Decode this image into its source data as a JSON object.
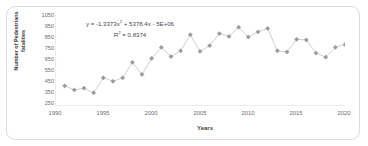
{
  "chart_data": {
    "type": "scatter",
    "title": "",
    "xlabel": "Years",
    "ylabel": "Number of Pedestrians\nfatalities",
    "ylabel_line1": "Number of Pedestrians",
    "ylabel_line2": "fatalities",
    "xlim": [
      1990,
      2020
    ],
    "ylim": [
      250,
      1050
    ],
    "ytick_step": 100,
    "xtick_step": 5,
    "grid": false,
    "legend": false,
    "marker": "diamond",
    "marker_color": "#9b9b9b",
    "line_color": "#c9c9c9",
    "trendline_color": "#4a4a4a",
    "axis_color": "#d0d0d0",
    "xticks": [
      1990,
      1995,
      2000,
      2005,
      2010,
      2015,
      2020
    ],
    "yticks": [
      1050,
      950,
      850,
      750,
      650,
      550,
      450,
      350,
      250
    ],
    "x": [
      1991,
      1992,
      1993,
      1994,
      1995,
      1996,
      1997,
      1998,
      1999,
      2000,
      2001,
      2002,
      2003,
      2004,
      2005,
      2006,
      2007,
      2008,
      2009,
      2010,
      2011,
      2012,
      2013,
      2014,
      2015,
      2016,
      2017,
      2018,
      2019,
      2020
    ],
    "values": [
      425,
      390,
      405,
      365,
      495,
      465,
      495,
      630,
      525,
      665,
      760,
      680,
      730,
      870,
      725,
      775,
      880,
      855,
      935,
      850,
      895,
      925,
      730,
      720,
      830,
      825,
      710,
      675,
      760,
      785
    ],
    "series": [
      {
        "name": "Number of Pedestrians fatalities",
        "values": [
          425,
          390,
          405,
          365,
          495,
          465,
          495,
          630,
          525,
          665,
          760,
          680,
          730,
          870,
          725,
          775,
          880,
          855,
          935,
          850,
          895,
          925,
          730,
          720,
          830,
          825,
          710,
          675,
          760,
          785
        ]
      }
    ],
    "trendline": {
      "type": "polynomial",
      "order": 2,
      "equation": "y = -1.3373x² + 5378.4x - 5E+06",
      "equation_prefix": "y = -1.3373x",
      "equation_suffix": " + 5378.4x - 5E+06",
      "r_squared_label": "R² = 0.8374",
      "r_squared_prefix": "R",
      "r_squared_suffix": " = 0.8374",
      "a": -1.3373,
      "b": 5378.4,
      "c": -5000000,
      "r_squared": 0.8374
    }
  }
}
